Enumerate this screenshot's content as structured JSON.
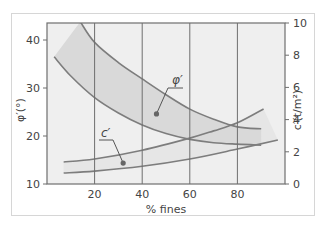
{
  "chart_data": {
    "type": "line",
    "title": "",
    "xlabel": "% fines",
    "ylabel_left": "φ′(°)",
    "ylabel_right": "c′(t/m²)",
    "xlim": [
      0,
      100
    ],
    "ylim_left": [
      10,
      44
    ],
    "ylim_right": [
      0,
      10
    ],
    "x_ticks": [
      "20",
      "40",
      "60",
      "80"
    ],
    "y_ticks_left": [
      "10",
      "20",
      "30",
      "40"
    ],
    "y_ticks_right": [
      "0",
      "2",
      "4",
      "6",
      "8",
      "10"
    ],
    "grid": "vertical lines at x = 20, 40, 60, 80",
    "series": [
      {
        "name": "φ′ upper bound",
        "axis": "left",
        "x": [
          14,
          20,
          30,
          40,
          50,
          60,
          70,
          80,
          90
        ],
        "values": [
          43.8,
          39.5,
          35.3,
          31.9,
          28.6,
          25.6,
          23.5,
          21.9,
          21.5
        ]
      },
      {
        "name": "φ′ lower bound",
        "axis": "left",
        "x": [
          3,
          10,
          20,
          30,
          40,
          50,
          60,
          70,
          80,
          90
        ],
        "values": [
          36.5,
          32.5,
          28.0,
          24.8,
          22.3,
          20.5,
          19.3,
          18.6,
          18.3,
          18.1
        ]
      },
      {
        "name": "c′ upper bound",
        "axis": "right",
        "x": [
          7,
          20,
          40,
          60,
          70,
          80,
          91
        ],
        "values": [
          1.37,
          1.55,
          2.1,
          2.85,
          3.3,
          3.8,
          4.66
        ]
      },
      {
        "name": "c′ lower bound",
        "axis": "right",
        "x": [
          7,
          20,
          40,
          60,
          80,
          97
        ],
        "values": [
          0.68,
          0.8,
          1.1,
          1.55,
          2.17,
          2.73
        ]
      }
    ],
    "annotations": [
      {
        "text": "φ′",
        "points_to": "φ′ band",
        "dot_at": [
          46,
          24.6
        ]
      },
      {
        "text": "c′",
        "points_to": "c′ band",
        "dot_at": [
          32,
          1.3
        ]
      }
    ],
    "colors": {
      "plot_bg": "#efefef",
      "phi_band": "#d9d9d9",
      "c_band": "#e6e6e6",
      "curve": "#7d7d7d",
      "axis": "#6e6e6e"
    }
  }
}
